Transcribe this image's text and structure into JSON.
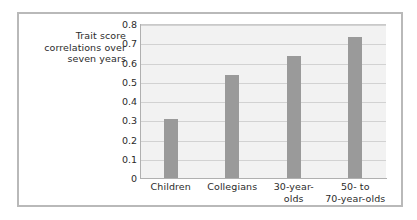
{
  "figure": {
    "axis_caption_lines": [
      "Trait score",
      "correlations over",
      "seven years"
    ],
    "frame_color": "#b9b9b9",
    "plot_background": "#f2f2f2",
    "bar_color": "#9a9a9a",
    "gridline_color": "#d2d2d2"
  },
  "chart_data": {
    "type": "bar",
    "title": "",
    "subtitle": "",
    "xlabel": "",
    "ylabel": "Trait score correlations over seven years",
    "categories": [
      "Children",
      "Collegians",
      "30-year-olds",
      "50- to 70-year-olds"
    ],
    "category_label_lines": [
      [
        "Children"
      ],
      [
        "Collegians"
      ],
      [
        "30-year-",
        "olds"
      ],
      [
        "50- to",
        "70-year-olds"
      ]
    ],
    "values": [
      0.31,
      0.54,
      0.64,
      0.74
    ],
    "ylim": [
      0,
      0.8
    ],
    "ytick_values": [
      0,
      0.1,
      0.2,
      0.3,
      0.4,
      0.5,
      0.6,
      0.7,
      0.8
    ],
    "ytick_labels": [
      "0",
      "0.1",
      "0.2",
      "0.3",
      "0.4",
      "0.5",
      "0.6",
      "0.7",
      "0.8"
    ],
    "grid": true,
    "legend": false,
    "legend_position": "none",
    "annotations": []
  }
}
